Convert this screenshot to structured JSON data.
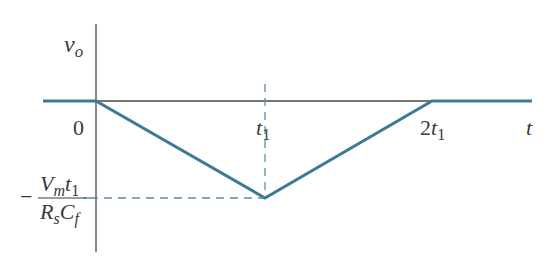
{
  "diagram": {
    "type": "waveform",
    "colors": {
      "axis": "#4a4a4a",
      "waveform": "#3d7a96",
      "dashed": "#5a8ea5",
      "text": "#3a3a3a"
    },
    "axes": {
      "y_label": "v",
      "y_label_sub": "o",
      "x_label": "t"
    },
    "ticks": {
      "origin": "0",
      "t1_main": "t",
      "t1_sub": "1",
      "two_t1_coef": "2",
      "two_t1_main": "t",
      "two_t1_sub": "1"
    },
    "min_value_label": {
      "sign": "−",
      "numerator_V": "V",
      "numerator_V_sub": "m",
      "numerator_t": "t",
      "numerator_t_sub": "1",
      "denominator_R": "R",
      "denominator_R_sub": "s",
      "denominator_C": "C",
      "denominator_C_sub": "f"
    },
    "waveform_points": [
      {
        "t": "-∞",
        "v": "0"
      },
      {
        "t": "0",
        "v": "0"
      },
      {
        "t": "t1",
        "v": "-Vm t1/(Rs Cf)"
      },
      {
        "t": "2t1",
        "v": "0"
      },
      {
        "t": "+∞",
        "v": "0"
      }
    ]
  }
}
